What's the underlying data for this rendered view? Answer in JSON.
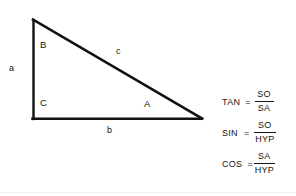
{
  "figure": {
    "background_color": "#ffffff",
    "line_color": "#111111",
    "text_color": "#141414"
  },
  "triangle": {
    "description": "Right triangle with the right angle at the lower-left vertex",
    "vertices": {
      "apex": {
        "label": "B",
        "x": 33,
        "y": 20
      },
      "right_angle": {
        "label": "C",
        "x": 33,
        "y": 119
      },
      "acute": {
        "label": "A",
        "x": 201,
        "y": 119
      }
    },
    "angle_labels": [
      {
        "name": "B",
        "text": "B"
      },
      {
        "name": "C",
        "text": "C"
      },
      {
        "name": "A",
        "text": "A"
      }
    ],
    "side_labels": [
      {
        "name": "a",
        "text": "a",
        "side": "vertical-left"
      },
      {
        "name": "b",
        "text": "b",
        "side": "base-bottom"
      },
      {
        "name": "c",
        "text": "c",
        "side": "hypotenuse"
      }
    ]
  },
  "formulas": {
    "rows": [
      {
        "name": "TAN",
        "equals": "=",
        "numerator": "SO",
        "denominator": "SA"
      },
      {
        "name": "SIN",
        "equals": "=",
        "numerator": "SO",
        "denominator": "HYP"
      },
      {
        "name": "COS",
        "equals": "=",
        "numerator": "SA",
        "denominator": "HYP"
      }
    ]
  }
}
